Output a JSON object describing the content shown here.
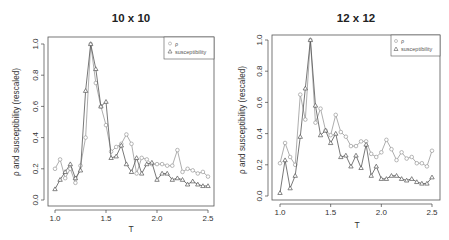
{
  "colors": {
    "rho": "#999999",
    "susceptibility": "#555555",
    "axis": "#444444",
    "text": "#222222",
    "frame": "#555555"
  },
  "chart_data": [
    {
      "type": "line",
      "title": "10 x 10",
      "xlabel": "T",
      "ylabel": "ρ and susceptibility (rescaled)",
      "xlim": [
        1.0,
        2.5
      ],
      "ylim": [
        0.0,
        1.0
      ],
      "xticks": [
        "1.0",
        "1.5",
        "2.0",
        "2.5"
      ],
      "yticks": [
        "0.0",
        "0.2",
        "0.4",
        "0.6",
        "0.8",
        "1.0"
      ],
      "grid": false,
      "legend_position": "top-right",
      "x": [
        1.0,
        1.05,
        1.1,
        1.15,
        1.2,
        1.25,
        1.3,
        1.35,
        1.4,
        1.45,
        1.5,
        1.55,
        1.6,
        1.65,
        1.7,
        1.75,
        1.8,
        1.85,
        1.9,
        1.95,
        2.0,
        2.05,
        2.1,
        2.15,
        2.2,
        2.25,
        2.3,
        2.35,
        2.4,
        2.45,
        2.5
      ],
      "series": [
        {
          "name": "ρ",
          "marker": "circle",
          "values": [
            0.2,
            0.26,
            0.14,
            0.2,
            0.11,
            0.22,
            0.4,
            1.0,
            0.75,
            0.6,
            0.48,
            0.31,
            0.34,
            0.36,
            0.42,
            0.36,
            0.17,
            0.27,
            0.26,
            0.23,
            0.23,
            0.23,
            0.22,
            0.22,
            0.32,
            0.18,
            0.2,
            0.19,
            0.17,
            0.18,
            0.15
          ]
        },
        {
          "name": "susceptibility",
          "marker": "triangle",
          "values": [
            0.07,
            0.13,
            0.18,
            0.23,
            0.14,
            0.19,
            0.7,
            1.0,
            0.84,
            0.6,
            0.63,
            0.27,
            0.28,
            0.35,
            0.23,
            0.18,
            0.27,
            0.17,
            0.23,
            0.24,
            0.13,
            0.17,
            0.17,
            0.13,
            0.14,
            0.13,
            0.1,
            0.12,
            0.1,
            0.09,
            0.09
          ]
        }
      ]
    },
    {
      "type": "line",
      "title": "12 x 12",
      "xlabel": "T",
      "ylabel": "ρ and susceptibility (rescaled)",
      "xlim": [
        1.0,
        2.5
      ],
      "ylim": [
        0.0,
        1.0
      ],
      "xticks": [
        "1.0",
        "1.5",
        "2.0",
        "2.5"
      ],
      "yticks": [
        "0.0",
        "0.2",
        "0.4",
        "0.6",
        "0.8",
        "1.0"
      ],
      "grid": false,
      "legend_position": "top-right",
      "x": [
        1.0,
        1.05,
        1.1,
        1.15,
        1.2,
        1.25,
        1.3,
        1.35,
        1.4,
        1.45,
        1.5,
        1.55,
        1.6,
        1.65,
        1.7,
        1.75,
        1.8,
        1.85,
        1.9,
        1.95,
        2.0,
        2.05,
        2.1,
        2.15,
        2.2,
        2.25,
        2.3,
        2.35,
        2.4,
        2.45,
        2.5
      ],
      "series": [
        {
          "name": "ρ",
          "marker": "circle",
          "values": [
            0.21,
            0.34,
            0.25,
            0.2,
            0.65,
            0.49,
            1.0,
            0.47,
            0.56,
            0.42,
            0.39,
            0.52,
            0.41,
            0.38,
            0.32,
            0.32,
            0.35,
            0.35,
            0.27,
            0.25,
            0.28,
            0.36,
            0.3,
            0.23,
            0.28,
            0.24,
            0.25,
            0.21,
            0.21,
            0.19,
            0.29
          ]
        },
        {
          "name": "susceptibility",
          "marker": "triangle",
          "values": [
            0.02,
            0.23,
            0.05,
            0.13,
            0.38,
            0.69,
            1.0,
            0.58,
            0.39,
            0.42,
            0.34,
            0.4,
            0.25,
            0.26,
            0.19,
            0.26,
            0.18,
            0.33,
            0.13,
            0.19,
            0.11,
            0.11,
            0.13,
            0.13,
            0.11,
            0.1,
            0.11,
            0.09,
            0.08,
            0.08,
            0.12
          ]
        }
      ]
    }
  ]
}
